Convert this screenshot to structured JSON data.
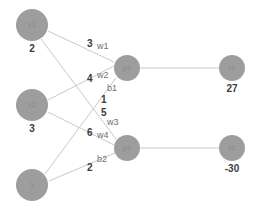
{
  "diagram": {
    "type": "neural-network",
    "node_color": "#9d9d9d",
    "edge_color": "#c9c9c9",
    "value_color": "#3b3b3b",
    "symbol_color": "#6f6f6f",
    "background": "#ffffff"
  },
  "nodes": {
    "input": [
      {
        "id": "x1",
        "label": "x1",
        "value": "2",
        "cx": 32,
        "cy": 25,
        "r": 16
      },
      {
        "id": "x2",
        "label": "x2",
        "value": "3",
        "cx": 32,
        "cy": 105,
        "r": 16
      },
      {
        "id": "bias",
        "label": "1",
        "value": "",
        "cx": 32,
        "cy": 185,
        "r": 16
      }
    ],
    "hidden": [
      {
        "id": "y1",
        "label": "y1",
        "value": "",
        "cx": 127,
        "cy": 68,
        "r": 13
      },
      {
        "id": "y2",
        "label": "y2",
        "value": "",
        "cx": 127,
        "cy": 148,
        "r": 13
      }
    ],
    "output": [
      {
        "id": "t1",
        "label": "t1",
        "value": "27",
        "cx": 232,
        "cy": 68,
        "r": 13
      },
      {
        "id": "t2",
        "label": "t2",
        "value": "-30",
        "cx": 232,
        "cy": 148,
        "r": 13
      }
    ]
  },
  "edges": [
    {
      "id": "e-x1-y1",
      "from": "x1",
      "to": "y1",
      "weight_name": "w1",
      "weight_value": "3",
      "x1": 48,
      "y1": 31,
      "x2": 114,
      "y2": 62
    },
    {
      "id": "e-x2-y1",
      "from": "x2",
      "to": "y1",
      "weight_name": "w2",
      "weight_value": "4",
      "x1": 48,
      "y1": 100,
      "x2": 114,
      "y2": 66
    },
    {
      "id": "e-bias-y1",
      "from": "bias",
      "to": "y1",
      "weight_name": "b1",
      "weight_value": "1",
      "x1": 45,
      "y1": 174,
      "x2": 116,
      "y2": 78
    },
    {
      "id": "e-x1-y2",
      "from": "x1",
      "to": "y2",
      "weight_name": "w3",
      "weight_value": "5",
      "x1": 41,
      "y1": 39,
      "x2": 116,
      "y2": 139
    },
    {
      "id": "e-x2-y2",
      "from": "x2",
      "to": "y2",
      "weight_name": "w4",
      "weight_value": "6",
      "x1": 48,
      "y1": 112,
      "x2": 114,
      "y2": 145
    },
    {
      "id": "e-bias-y2",
      "from": "bias",
      "to": "y2",
      "weight_name": "b2",
      "weight_value": "2",
      "x1": 49,
      "y1": 181,
      "x2": 115,
      "y2": 153
    },
    {
      "id": "e-y1-t1",
      "from": "y1",
      "to": "t1",
      "weight_name": "",
      "weight_value": "",
      "x1": 140,
      "y1": 68,
      "x2": 219,
      "y2": 68
    },
    {
      "id": "e-y2-t2",
      "from": "y2",
      "to": "t2",
      "weight_name": "",
      "weight_value": "",
      "x1": 140,
      "y1": 148,
      "x2": 219,
      "y2": 148
    }
  ],
  "edge_labels": [
    {
      "id": "lbl-w1",
      "value": "3",
      "symbol": "w1",
      "vx": 87,
      "vy": 39,
      "sx": 97,
      "sy": 42
    },
    {
      "id": "lbl-w2",
      "value": "4",
      "symbol": "w2",
      "vx": 87,
      "vy": 74,
      "sx": 97,
      "sy": 71
    },
    {
      "id": "lbl-b1",
      "value": "1",
      "symbol": "b1",
      "vx": 101,
      "vy": 95,
      "sx": 107,
      "sy": 84
    },
    {
      "id": "lbl-w3",
      "value": "5",
      "symbol": "w3",
      "vx": 101,
      "vy": 108,
      "sx": 107,
      "sy": 118
    },
    {
      "id": "lbl-w4",
      "value": "6",
      "symbol": "w4",
      "vx": 87,
      "vy": 128,
      "sx": 97,
      "sy": 131
    },
    {
      "id": "lbl-b2",
      "value": "2",
      "symbol": "b2",
      "vx": 87,
      "vy": 163,
      "sx": 97,
      "sy": 155
    }
  ]
}
